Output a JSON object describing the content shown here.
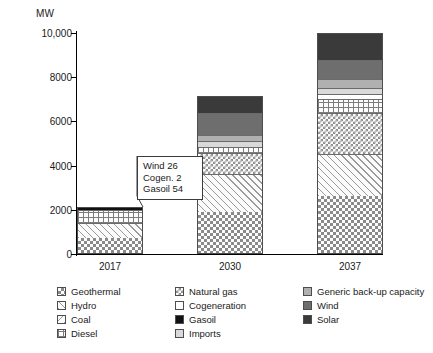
{
  "chart_data": {
    "type": "bar",
    "title": "",
    "subtitle": "",
    "xlabel": "",
    "ylabel": "MW",
    "unit_label": "MW",
    "grid": false,
    "stacked": true,
    "legend_position": "bottom",
    "categories": [
      "2017",
      "2030",
      "2037"
    ],
    "ylim": [
      0,
      10000
    ],
    "yticks": [
      0,
      2000,
      4000,
      6000,
      8000,
      10000
    ],
    "ytick_labels": [
      "0",
      "2000",
      "4000",
      "6000",
      "8000",
      "10,000"
    ],
    "series": [
      {
        "name": "Geothermal",
        "values": [
          700,
          1900,
          2600
        ]
      },
      {
        "name": "Hydro",
        "values": [
          720,
          1700,
          1900
        ]
      },
      {
        "name": "Coal",
        "values": [
          0,
          0,
          0
        ]
      },
      {
        "name": "Natural gas",
        "values": [
          0,
          1000,
          1900
        ]
      },
      {
        "name": "Diesel",
        "values": [
          620,
          250,
          650
        ]
      },
      {
        "name": "Cogeneration",
        "values": [
          2,
          0,
          230
        ]
      },
      {
        "name": "Gasoil",
        "values": [
          54,
          0,
          0
        ]
      },
      {
        "name": "Imports",
        "values": [
          0,
          280,
          250
        ]
      },
      {
        "name": "Generic back-up capacity",
        "values": [
          0,
          270,
          400
        ]
      },
      {
        "name": "Wind",
        "values": [
          26,
          1000,
          900
        ]
      },
      {
        "name": "Solar",
        "values": [
          0,
          750,
          1170
        ]
      }
    ],
    "totals": [
      2122,
      7150,
      10000
    ],
    "annotations": [
      {
        "target_category": "2017",
        "lines": [
          "Wind 26",
          "Cogen. 2",
          "Gasoil 54"
        ]
      }
    ]
  },
  "axis": {
    "unit": "MW",
    "ticks": [
      {
        "label": "10,000",
        "value": 10000
      },
      {
        "label": "8000",
        "value": 8000
      },
      {
        "label": "6000",
        "value": 6000
      },
      {
        "label": "4000",
        "value": 4000
      },
      {
        "label": "2000",
        "value": 2000
      },
      {
        "label": "0",
        "value": 0
      }
    ],
    "categories": [
      "2017",
      "2030",
      "2037"
    ]
  },
  "callout": {
    "line1": "Wind 26",
    "line2": "Cogen. 2",
    "line3": "Gasoil 54"
  },
  "legend": {
    "columns": [
      {
        "items": [
          {
            "label": "Geothermal",
            "pattern": "p-geothermal"
          },
          {
            "label": "Hydro",
            "pattern": "p-hydro"
          },
          {
            "label": "Coal",
            "pattern": "p-coal"
          },
          {
            "label": "Diesel",
            "pattern": "p-diesel"
          }
        ]
      },
      {
        "items": [
          {
            "label": "Natural gas",
            "pattern": "p-natural-gas"
          },
          {
            "label": "Cogeneration",
            "pattern": "p-cogeneration"
          },
          {
            "label": "Gasoil",
            "pattern": "p-gasoil"
          },
          {
            "label": "Imports",
            "pattern": "p-imports"
          }
        ]
      },
      {
        "items": [
          {
            "label": "Generic back-up capacity",
            "pattern": "p-generic"
          },
          {
            "label": "Wind",
            "pattern": "p-wind"
          },
          {
            "label": "Solar",
            "pattern": "p-solar"
          }
        ]
      }
    ]
  },
  "colors": {
    "gasoil": "#111111",
    "solar": "#3a3a3a",
    "wind": "#6e6e6e",
    "generic_backup": "#b0b0b0",
    "imports": "#d9d9d9",
    "cogeneration": "#ffffff",
    "axis": "#000000",
    "outline": "#4d4d4d"
  },
  "bar_stacks": [
    {
      "category": "2017",
      "segments": [
        {
          "series": "Geothermal",
          "value": 700,
          "pattern": "p-geothermal"
        },
        {
          "series": "Hydro",
          "value": 720,
          "pattern": "p-hydro"
        },
        {
          "series": "Diesel",
          "value": 620,
          "pattern": "p-diesel"
        },
        {
          "series": "Gasoil",
          "value": 82,
          "pattern": "p-gasoil"
        }
      ]
    },
    {
      "category": "2030",
      "segments": [
        {
          "series": "Geothermal",
          "value": 1900,
          "pattern": "p-geothermal"
        },
        {
          "series": "Hydro",
          "value": 1700,
          "pattern": "p-hydro"
        },
        {
          "series": "Natural gas",
          "value": 1000,
          "pattern": "p-natural-gas"
        },
        {
          "series": "Diesel",
          "value": 250,
          "pattern": "p-diesel"
        },
        {
          "series": "Imports",
          "value": 280,
          "pattern": "p-imports"
        },
        {
          "series": "Generic back-up capacity",
          "value": 270,
          "pattern": "p-generic"
        },
        {
          "series": "Wind",
          "value": 1000,
          "pattern": "p-wind"
        },
        {
          "series": "Solar",
          "value": 750,
          "pattern": "p-solar"
        }
      ]
    },
    {
      "category": "2037",
      "segments": [
        {
          "series": "Geothermal",
          "value": 2600,
          "pattern": "p-geothermal"
        },
        {
          "series": "Hydro",
          "value": 1900,
          "pattern": "p-hydro"
        },
        {
          "series": "Natural gas",
          "value": 1900,
          "pattern": "p-natural-gas"
        },
        {
          "series": "Diesel",
          "value": 650,
          "pattern": "p-diesel"
        },
        {
          "series": "Cogeneration",
          "value": 230,
          "pattern": "p-cogeneration"
        },
        {
          "series": "Imports",
          "value": 250,
          "pattern": "p-imports"
        },
        {
          "series": "Generic back-up capacity",
          "value": 400,
          "pattern": "p-generic"
        },
        {
          "series": "Wind",
          "value": 900,
          "pattern": "p-wind"
        },
        {
          "series": "Solar",
          "value": 1170,
          "pattern": "p-solar"
        }
      ]
    }
  ]
}
